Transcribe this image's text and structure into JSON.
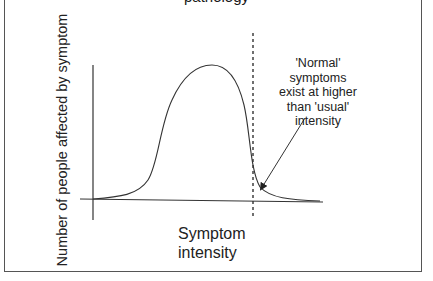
{
  "diagram": {
    "title_fragment": "pathology",
    "y_axis_label": "Number of people affected by symptom",
    "x_axis_label_line1": "Symptom",
    "x_axis_label_line2": "intensity",
    "annotation": {
      "lines": [
        "'Normal'",
        "symptoms",
        "exist at higher",
        "than 'usual'",
        "intensity"
      ]
    },
    "curve": "bell-shaped distribution of symptom intensity with a long right tail",
    "threshold": "dashed vertical line marking 'usual' intensity cutoff"
  },
  "colors": {
    "line": "#333333",
    "border": "#555555",
    "background": "#ffffff"
  }
}
